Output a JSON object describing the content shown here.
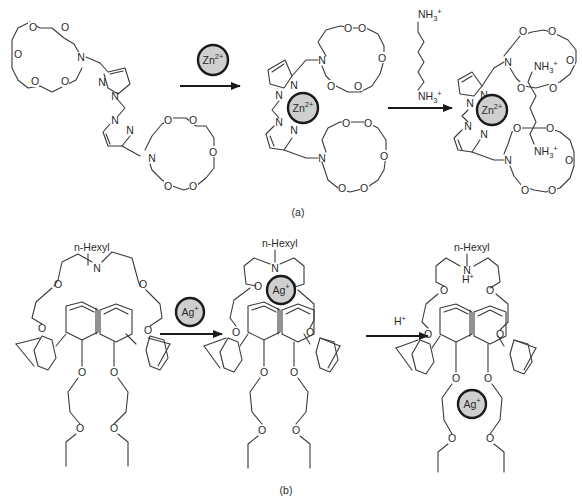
{
  "panels": {
    "a": {
      "caption": "(a)",
      "reagent_1": "Zn2+",
      "bound_ion": "Zn2+",
      "reagent_2_top": "NH3+",
      "reagent_2_bottom": "NH3+",
      "guest_top": "NH3+",
      "guest_bottom": "NH3+"
    },
    "b": {
      "caption": "(b)",
      "substituent": "n-Hexyl",
      "reagent_1": "Ag+",
      "bound_ion": "Ag+",
      "reagent_2": "H+",
      "protonated_label": "H+",
      "released_ion": "Ag+"
    }
  },
  "atoms": {
    "O": "O",
    "N": "N"
  },
  "colors": {
    "ion_fill": "#cfcfcf",
    "ion_stroke": "#1a1a1a",
    "bond": "#3a3a3a",
    "background": "#ffffff"
  }
}
